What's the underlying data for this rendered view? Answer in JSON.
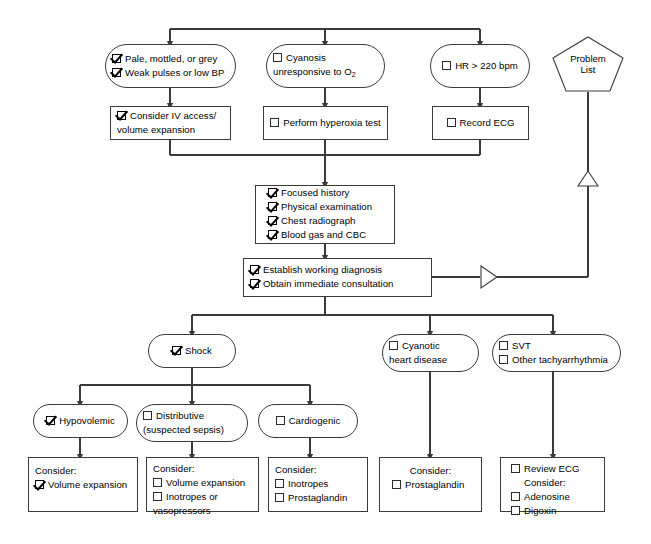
{
  "diagram": {
    "problem_list": {
      "line1": "Problem",
      "line2": "List"
    }
  },
  "labels": {
    "consider": "Consider:"
  },
  "nodes": {
    "sign_shock": {
      "name": "pale-mottled-grey-node",
      "items": [
        {
          "text": "Pale, mottled, or grey",
          "checked": true
        },
        {
          "text": "Weak pulses or low BP",
          "checked": true
        }
      ]
    },
    "sign_cyanosis": {
      "name": "cyanosis-node",
      "items": [
        {
          "text": "Cyanosis",
          "checked": false
        },
        {
          "text": "unresponsive to O",
          "sub": "2",
          "checked": false,
          "continuation": true
        }
      ]
    },
    "sign_hr": {
      "name": "hr-node",
      "items": [
        {
          "text": "HR > 220 bpm",
          "checked": false
        }
      ]
    },
    "act_iv": {
      "name": "consider-iv-access-node",
      "items": [
        {
          "text": "Consider IV access/",
          "checked": true
        },
        {
          "text": "volume expansion",
          "checked": false,
          "continuation": true
        }
      ]
    },
    "act_hyperoxia": {
      "name": "perform-hyperoxia-test-node",
      "items": [
        {
          "text": "Perform hyperoxia test",
          "checked": false
        }
      ]
    },
    "act_ecg": {
      "name": "record-ecg-node",
      "items": [
        {
          "text": "Record ECG",
          "checked": false
        }
      ]
    },
    "workup": {
      "name": "workup-node",
      "items": [
        {
          "text": "Focused history",
          "checked": true
        },
        {
          "text": "Physical examination",
          "checked": true
        },
        {
          "text": "Chest radiograph",
          "checked": true
        },
        {
          "text": "Blood gas and CBC",
          "checked": true
        }
      ]
    },
    "diagnosis": {
      "name": "working-diagnosis-node",
      "items": [
        {
          "text": "Establish working diagnosis",
          "checked": true
        },
        {
          "text": "Obtain immediate consultation",
          "checked": true
        }
      ]
    },
    "shock": {
      "name": "shock-node",
      "items": [
        {
          "text": "Shock",
          "checked": true
        }
      ]
    },
    "cyanotic_heart": {
      "name": "cyanotic-heart-disease-node",
      "items": [
        {
          "text": "Cyanotic",
          "checked": false
        },
        {
          "text": "heart disease",
          "checked": false,
          "continuation": true
        }
      ]
    },
    "svt": {
      "name": "svt-node",
      "items": [
        {
          "text": "SVT",
          "checked": false
        },
        {
          "text": "Other tachyarrhythmia",
          "checked": false
        }
      ]
    },
    "hypovolemic": {
      "name": "hypovolemic-node",
      "items": [
        {
          "text": "Hypovolemic",
          "checked": true
        }
      ]
    },
    "distributive": {
      "name": "distributive-node",
      "items": [
        {
          "text": "Distributive",
          "checked": false
        },
        {
          "text": "(suspected sepsis)",
          "checked": false,
          "continuation": true
        }
      ]
    },
    "cardiogenic": {
      "name": "cardiogenic-node",
      "items": [
        {
          "text": "Cardiogenic",
          "checked": false
        }
      ]
    },
    "tx_hypovolemic": {
      "name": "treatment-hypovolemic-node",
      "items": [
        {
          "text": "Consider:",
          "checked": null
        },
        {
          "text": "Volume expansion",
          "checked": true
        }
      ]
    },
    "tx_distributive": {
      "name": "treatment-distributive-node",
      "items": [
        {
          "text": "Consider:",
          "checked": null
        },
        {
          "text": "Volume expansion",
          "checked": false
        },
        {
          "text": "Inotropes or",
          "checked": false
        },
        {
          "text": "vasopressors",
          "checked": false,
          "continuation": true
        }
      ]
    },
    "tx_cardiogenic": {
      "name": "treatment-cardiogenic-node",
      "items": [
        {
          "text": "Consider:",
          "checked": null
        },
        {
          "text": "Inotropes",
          "checked": false
        },
        {
          "text": "Prostaglandin",
          "checked": false
        }
      ]
    },
    "tx_cyanotic": {
      "name": "treatment-cyanotic-node",
      "items": [
        {
          "text": "Consider:",
          "checked": null
        },
        {
          "text": "Prostaglandin",
          "checked": false
        }
      ]
    },
    "tx_svt": {
      "name": "treatment-svt-node",
      "items": [
        {
          "text": "Review ECG",
          "checked": false
        },
        {
          "text": "Consider:",
          "checked": null
        },
        {
          "text": "Adenosine",
          "checked": false
        },
        {
          "text": "Digoxin",
          "checked": false
        }
      ]
    }
  },
  "colors": {
    "line": "#3a3a3a",
    "text": "#000000",
    "background": "#ffffff"
  }
}
